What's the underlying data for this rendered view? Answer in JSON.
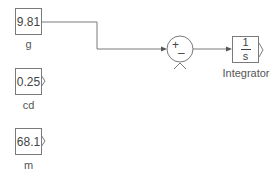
{
  "blocks": {
    "g": {
      "value": "9.81",
      "label": "g"
    },
    "cd": {
      "value": "0.25",
      "label": "cd"
    },
    "m": {
      "value": "68.1",
      "label": "m"
    },
    "sum": {
      "signs": [
        "+",
        "–"
      ]
    },
    "integrator": {
      "numerator": "1",
      "denominator": "s",
      "label": "Integrator"
    }
  },
  "colors": {
    "stroke": "#7a7a7a",
    "text": "#444444",
    "background": "#ffffff"
  }
}
